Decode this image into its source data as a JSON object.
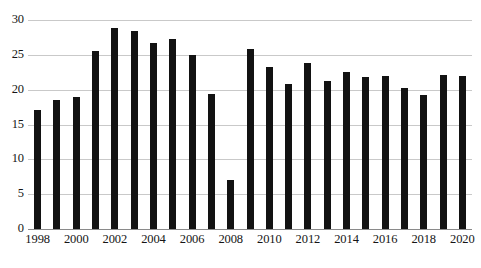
{
  "chart_data": {
    "type": "bar",
    "title": "",
    "subtitle": "",
    "xlabel": "",
    "ylabel": "",
    "categories": [
      "1998",
      "1999",
      "2000",
      "2001",
      "2002",
      "2003",
      "2004",
      "2005",
      "2006",
      "2007",
      "2008",
      "2009",
      "2010",
      "2011",
      "2012",
      "2013",
      "2014",
      "2015",
      "2016",
      "2017",
      "2018",
      "2019",
      "2020"
    ],
    "values": [
      17.1,
      18.5,
      18.9,
      25.6,
      28.9,
      28.4,
      26.7,
      27.3,
      25.0,
      19.4,
      7.0,
      25.9,
      23.3,
      20.8,
      23.9,
      21.2,
      22.6,
      21.8,
      22.0,
      20.2,
      19.2,
      22.1,
      22.0
    ],
    "series": [
      {
        "name": "",
        "values": [
          17.1,
          18.5,
          18.9,
          25.6,
          28.9,
          28.4,
          26.7,
          27.3,
          25.0,
          19.4,
          7.0,
          25.9,
          23.3,
          20.8,
          23.9,
          21.2,
          22.6,
          21.8,
          22.0,
          20.2,
          19.2,
          22.1,
          22.0
        ]
      }
    ],
    "ylim": [
      0,
      30
    ],
    "yticks": [
      0,
      5,
      10,
      15,
      20,
      25,
      30
    ],
    "ytick_labels": [
      "0",
      "5",
      "10",
      "15",
      "20",
      "25",
      "30"
    ],
    "xtick_labels": [
      "1998",
      "2000",
      "2002",
      "2004",
      "2006",
      "2008",
      "2010",
      "2012",
      "2014",
      "2016",
      "2018",
      "2020"
    ],
    "grid": true,
    "legend": false,
    "legend_position": "none",
    "bar_color": "#121212",
    "gridline_color": "#c9c9c9",
    "axis_color": "#8a8a8a",
    "background_color": "#ffffff"
  }
}
